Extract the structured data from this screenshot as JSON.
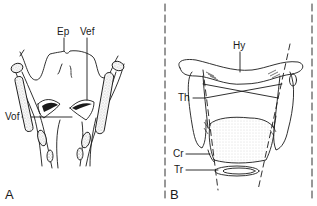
{
  "figure": {
    "panels": [
      {
        "id": "A",
        "letter": "A",
        "view": "internal coronal view of larynx",
        "labels": {
          "ep": "Ep",
          "vef": "Vef",
          "vof": "Vof"
        }
      },
      {
        "id": "B",
        "letter": "B",
        "view": "external anterior view of larynx",
        "labels": {
          "hy": "Hy",
          "th": "Th",
          "cr": "Cr",
          "tr": "Tr"
        }
      }
    ],
    "colors": {
      "line": "#1a1a1a",
      "stipple": "#9a9a9a",
      "background": "#ffffff"
    }
  }
}
